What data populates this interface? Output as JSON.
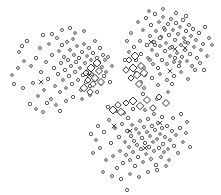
{
  "figure": {
    "title": "",
    "subtitle": "",
    "background_color": "#ffffff",
    "width": 221,
    "height": 195,
    "axes_visible": false,
    "grid_visible": false,
    "legend_visible": false,
    "ticks_visible": false
  },
  "style": {
    "circle_stroke": "#3b3b3b",
    "circle_fill": "#ffffff",
    "diamond_stroke": "#2b2b2b",
    "diamond_fill": "#ffffff",
    "x_stroke": "#404040"
  },
  "chart_data": {
    "type": "scatter",
    "title": "",
    "xlabel": "",
    "ylabel": "",
    "xlim": [
      0,
      221
    ],
    "ylim": [
      0,
      195
    ],
    "grid": false,
    "legend_position": "none",
    "axes": false,
    "cluster_count": 3,
    "clusters": [
      {
        "name": "left-cluster",
        "center_x": 80,
        "center_y": 70,
        "point_count": 92
      },
      {
        "name": "top-right-cluster",
        "center_x": 165,
        "center_y": 50,
        "point_count": 108
      },
      {
        "name": "bottom-cluster",
        "center_x": 140,
        "center_y": 135,
        "point_count": 88
      }
    ],
    "series": [
      {
        "name": "circles",
        "marker": "open-circle",
        "marker_size": 3.0,
        "color": "#3b3b3b",
        "points": [
          [
            12,
            75
          ],
          [
            19,
            52
          ],
          [
            23,
            88
          ],
          [
            27,
            41
          ],
          [
            31,
            66
          ],
          [
            33,
            83
          ],
          [
            36,
            58
          ],
          [
            38,
            96
          ],
          [
            40,
            48
          ],
          [
            41,
            72
          ],
          [
            43,
            35
          ],
          [
            44,
            90
          ],
          [
            46,
            62
          ],
          [
            48,
            79
          ],
          [
            49,
            44
          ],
          [
            51,
            99
          ],
          [
            52,
            55
          ],
          [
            54,
            68
          ],
          [
            55,
            86
          ],
          [
            57,
            38
          ],
          [
            58,
            74
          ],
          [
            59,
            51
          ],
          [
            60,
            92
          ],
          [
            61,
            63
          ],
          [
            62,
            45
          ],
          [
            63,
            80
          ],
          [
            64,
            57
          ],
          [
            65,
            70
          ],
          [
            66,
            88
          ],
          [
            67,
            42
          ],
          [
            68,
            60
          ],
          [
            69,
            76
          ],
          [
            70,
            50
          ],
          [
            71,
            66
          ],
          [
            72,
            84
          ],
          [
            73,
            39
          ],
          [
            74,
            55
          ],
          [
            75,
            72
          ],
          [
            76,
            62
          ],
          [
            77,
            46
          ],
          [
            78,
            80
          ],
          [
            79,
            58
          ],
          [
            80,
            68
          ],
          [
            81,
            90
          ],
          [
            82,
            52
          ],
          [
            83,
            75
          ],
          [
            84,
            44
          ],
          [
            85,
            63
          ],
          [
            86,
            82
          ],
          [
            87,
            56
          ],
          [
            88,
            70
          ],
          [
            89,
            48
          ],
          [
            90,
            86
          ],
          [
            91,
            60
          ],
          [
            92,
            74
          ],
          [
            93,
            53
          ],
          [
            94,
            66
          ],
          [
            95,
            41
          ],
          [
            96,
            79
          ],
          [
            97,
            58
          ],
          [
            98,
            71
          ],
          [
            99,
            62
          ],
          [
            100,
            48
          ],
          [
            101,
            84
          ],
          [
            102,
            67
          ],
          [
            103,
            55
          ],
          [
            104,
            76
          ],
          [
            105,
            60
          ],
          [
            62,
            30
          ],
          [
            70,
            28
          ],
          [
            75,
            33
          ],
          [
            84,
            31
          ],
          [
            52,
            34
          ],
          [
            47,
            103
          ],
          [
            56,
            105
          ],
          [
            66,
            101
          ],
          [
            73,
            97
          ],
          [
            82,
            99
          ],
          [
            90,
            95
          ],
          [
            97,
            92
          ],
          [
            30,
            104
          ],
          [
            36,
            109
          ],
          [
            43,
            112
          ],
          [
            60,
            111
          ],
          [
            24,
            61
          ],
          [
            18,
            68
          ],
          [
            14,
            84
          ],
          [
            22,
            46
          ],
          [
            106,
            72
          ],
          [
            108,
            57
          ],
          [
            110,
            82
          ],
          [
            112,
            66
          ],
          [
            131,
            33
          ],
          [
            134,
            47
          ],
          [
            136,
            60
          ],
          [
            138,
            22
          ],
          [
            140,
            41
          ],
          [
            141,
            54
          ],
          [
            143,
            30
          ],
          [
            144,
            68
          ],
          [
            146,
            18
          ],
          [
            147,
            45
          ],
          [
            148,
            58
          ],
          [
            150,
            36
          ],
          [
            151,
            25
          ],
          [
            152,
            50
          ],
          [
            153,
            64
          ],
          [
            154,
            42
          ],
          [
            155,
            14
          ],
          [
            156,
            31
          ],
          [
            157,
            55
          ],
          [
            158,
            68
          ],
          [
            159,
            22
          ],
          [
            160,
            46
          ],
          [
            161,
            37
          ],
          [
            162,
            60
          ],
          [
            163,
            17
          ],
          [
            164,
            28
          ],
          [
            165,
            51
          ],
          [
            166,
            43
          ],
          [
            167,
            64
          ],
          [
            168,
            24
          ],
          [
            169,
            35
          ],
          [
            170,
            56
          ],
          [
            171,
            19
          ],
          [
            172,
            47
          ],
          [
            173,
            30
          ],
          [
            174,
            62
          ],
          [
            175,
            40
          ],
          [
            176,
            23
          ],
          [
            177,
            53
          ],
          [
            178,
            34
          ],
          [
            179,
            66
          ],
          [
            180,
            27
          ],
          [
            181,
            45
          ],
          [
            182,
            57
          ],
          [
            183,
            20
          ],
          [
            184,
            38
          ],
          [
            185,
            50
          ],
          [
            186,
            31
          ],
          [
            187,
            61
          ],
          [
            188,
            43
          ],
          [
            189,
            25
          ],
          [
            190,
            54
          ],
          [
            191,
            36
          ],
          [
            192,
            66
          ],
          [
            193,
            29
          ],
          [
            194,
            47
          ],
          [
            196,
            40
          ],
          [
            197,
            58
          ],
          [
            199,
            33
          ],
          [
            201,
            50
          ],
          [
            203,
            44
          ],
          [
            205,
            27
          ],
          [
            207,
            56
          ],
          [
            209,
            38
          ],
          [
            145,
            75
          ],
          [
            152,
            78
          ],
          [
            160,
            74
          ],
          [
            167,
            80
          ],
          [
            174,
            76
          ],
          [
            181,
            72
          ],
          [
            188,
            79
          ],
          [
            195,
            70
          ],
          [
            136,
            73
          ],
          [
            141,
            82
          ],
          [
            158,
            85
          ],
          [
            172,
            84
          ],
          [
            149,
            11
          ],
          [
            163,
            9
          ],
          [
            176,
            13
          ],
          [
            186,
            16
          ],
          [
            129,
            52
          ],
          [
            127,
            41
          ],
          [
            125,
            60
          ],
          [
            133,
            66
          ],
          [
            144,
            88
          ],
          [
            200,
            63
          ],
          [
            204,
            70
          ],
          [
            212,
            45
          ],
          [
            157,
            99
          ],
          [
            143,
            94
          ],
          [
            168,
            92
          ],
          [
            150,
            60
          ],
          [
            155,
            45
          ],
          [
            160,
            38
          ],
          [
            165,
            30
          ],
          [
            170,
            48
          ],
          [
            175,
            58
          ],
          [
            180,
            62
          ],
          [
            185,
            42
          ],
          [
            100,
            148
          ],
          [
            104,
            132
          ],
          [
            106,
            160
          ],
          [
            109,
            120
          ],
          [
            111,
            143
          ],
          [
            113,
            156
          ],
          [
            115,
            128
          ],
          [
            117,
            168
          ],
          [
            119,
            137
          ],
          [
            120,
            151
          ],
          [
            122,
            124
          ],
          [
            123,
            163
          ],
          [
            125,
            142
          ],
          [
            126,
            155
          ],
          [
            127,
            131
          ],
          [
            128,
            118
          ],
          [
            129,
            147
          ],
          [
            130,
            160
          ],
          [
            131,
            136
          ],
          [
            132,
            125
          ],
          [
            133,
            152
          ],
          [
            134,
            141
          ],
          [
            135,
            166
          ],
          [
            136,
            129
          ],
          [
            137,
            145
          ],
          [
            138,
            157
          ],
          [
            139,
            133
          ],
          [
            140,
            121
          ],
          [
            141,
            149
          ],
          [
            142,
            138
          ],
          [
            143,
            162
          ],
          [
            144,
            127
          ],
          [
            145,
            143
          ],
          [
            146,
            154
          ],
          [
            147,
            132
          ],
          [
            148,
            119
          ],
          [
            149,
            147
          ],
          [
            150,
            136
          ],
          [
            151,
            159
          ],
          [
            152,
            126
          ],
          [
            153,
            142
          ],
          [
            154,
            151
          ],
          [
            155,
            130
          ],
          [
            156,
            165
          ],
          [
            157,
            139
          ],
          [
            158,
            123
          ],
          [
            159,
            148
          ],
          [
            160,
            134
          ],
          [
            161,
            157
          ],
          [
            162,
            128
          ],
          [
            163,
            144
          ],
          [
            164,
            152
          ],
          [
            165,
            137
          ],
          [
            167,
            126
          ],
          [
            168,
            149
          ],
          [
            170,
            140
          ],
          [
            172,
            131
          ],
          [
            174,
            146
          ],
          [
            176,
            135
          ],
          [
            178,
            153
          ],
          [
            180,
            128
          ],
          [
            183,
            142
          ],
          [
            186,
            133
          ],
          [
            190,
            147
          ],
          [
            108,
            107
          ],
          [
            116,
            111
          ],
          [
            124,
            113
          ],
          [
            133,
            109
          ],
          [
            96,
            140
          ],
          [
            93,
            153
          ],
          [
            98,
            126
          ],
          [
            91,
            134
          ],
          [
            103,
            172
          ],
          [
            112,
            176
          ],
          [
            121,
            179
          ],
          [
            130,
            174
          ],
          [
            139,
            177
          ],
          [
            148,
            172
          ],
          [
            157,
            170
          ],
          [
            166,
            166
          ],
          [
            173,
            118
          ],
          [
            181,
            114
          ],
          [
            169,
            160
          ],
          [
            187,
            122
          ],
          [
            127,
            190
          ],
          [
            162,
            117
          ],
          [
            145,
            110
          ],
          [
            154,
            114
          ]
        ]
      },
      {
        "name": "diamonds",
        "marker": "open-diamond",
        "marker_size": 6.0,
        "color": "#2b2b2b",
        "points": [
          [
            86,
            73
          ],
          [
            91,
            68
          ],
          [
            95,
            78
          ],
          [
            99,
            71
          ],
          [
            93,
            84
          ],
          [
            88,
            80
          ],
          [
            97,
            63
          ],
          [
            84,
            88
          ],
          [
            101,
            82
          ],
          [
            90,
            92
          ],
          [
            129,
            60
          ],
          [
            133,
            68
          ],
          [
            137,
            75
          ],
          [
            141,
            66
          ],
          [
            126,
            70
          ],
          [
            131,
            78
          ],
          [
            135,
            56
          ],
          [
            144,
            73
          ],
          [
            139,
            84
          ],
          [
            118,
            105
          ],
          [
            126,
            103
          ],
          [
            133,
            101
          ],
          [
            140,
            106
          ],
          [
            147,
            100
          ],
          [
            153,
            108
          ],
          [
            159,
            97
          ],
          [
            113,
            110
          ],
          [
            121,
            112
          ],
          [
            166,
            103
          ]
        ]
      },
      {
        "name": "crosses",
        "marker": "x",
        "marker_size": 4.0,
        "color": "#404040",
        "points": [
          [
            41,
            82
          ],
          [
            89,
            75
          ],
          [
            151,
            42
          ],
          [
            170,
            71
          ],
          [
            185,
            48
          ],
          [
            130,
            131
          ],
          [
            160,
            123
          ],
          [
            145,
            148
          ],
          [
            114,
            126
          ],
          [
            175,
            49
          ]
        ]
      }
    ]
  }
}
